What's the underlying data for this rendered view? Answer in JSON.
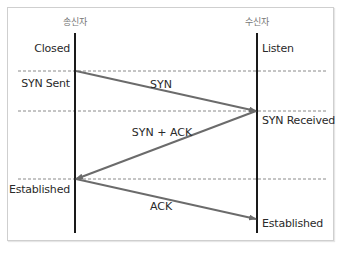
{
  "diagram": {
    "participants": [
      {
        "id": "sender",
        "label": "송신자"
      },
      {
        "id": "receiver",
        "label": "수신자"
      }
    ],
    "sender_states": [
      "Closed",
      "SYN Sent",
      "Established"
    ],
    "receiver_states": [
      "Listen",
      "SYN Received",
      "Established"
    ],
    "messages": [
      {
        "label": "SYN",
        "from": "sender",
        "to": "receiver"
      },
      {
        "label": "SYN + ACK",
        "from": "receiver",
        "to": "sender"
      },
      {
        "label": "ACK",
        "from": "sender",
        "to": "receiver"
      }
    ],
    "colors": {
      "lifeline": "#1a1a1a",
      "arrow": "#6b6b6b",
      "dashed": "#8a8a8a",
      "frame": "#cfcfcf"
    }
  }
}
